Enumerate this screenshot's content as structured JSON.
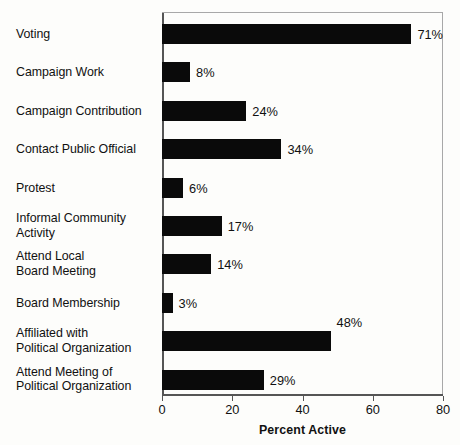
{
  "chart_data": {
    "type": "bar",
    "orientation": "horizontal",
    "title": "",
    "xlabel": "Percent Active",
    "ylabel": "",
    "xlim": [
      0,
      80
    ],
    "xticks": [
      0,
      20,
      40,
      60,
      80
    ],
    "xtick_labels": [
      "0",
      "20",
      "40",
      "60",
      "80"
    ],
    "grid": false,
    "legend": false,
    "bar_color": "#0a0a0a",
    "background_color": "#fdfdfb",
    "frame_color": "#a8a8a8",
    "categories": [
      "Voting",
      "Campaign Work",
      "Campaign Contribution",
      "Contact Public Official",
      "Protest",
      "Informal Community\nActivity",
      "Attend Local\nBoard Meeting",
      "Board Membership",
      "Affiliated with\nPolitical Organization",
      "Attend Meeting of\nPolitical Organization"
    ],
    "values": [
      71,
      8,
      24,
      34,
      6,
      17,
      14,
      3,
      48,
      29
    ],
    "value_labels": [
      "71%",
      "8%",
      "24%",
      "34%",
      "6%",
      "17%",
      "14%",
      "3%",
      "48%",
      "29%"
    ]
  }
}
